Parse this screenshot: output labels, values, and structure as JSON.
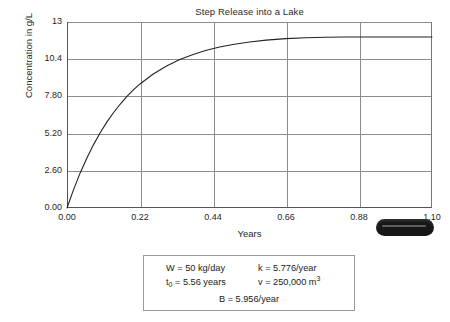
{
  "chart_data": {
    "type": "line",
    "title": "Step Release into a Lake",
    "xlabel": "Years",
    "ylabel": "Concentration in g/L",
    "xlim": [
      0.0,
      1.1
    ],
    "ylim": [
      0.0,
      13.0
    ],
    "grid": true,
    "legend": "none",
    "xticks": [
      "0.00",
      "0.22",
      "0.44",
      "0.66",
      "0.88",
      "1.10"
    ],
    "xtick_values": [
      0.0,
      0.22,
      0.44,
      0.66,
      0.88,
      1.1
    ],
    "yticks": [
      "0.00",
      "2.60",
      "5.20",
      "7.80",
      "10.4",
      "13"
    ],
    "ytick_values": [
      0.0,
      2.6,
      5.2,
      7.8,
      10.4,
      13.0
    ],
    "series": [
      {
        "name": "Concentration",
        "model": "C(t) = 11.95 * (1 - exp(-5.776 t))",
        "x": [
          0.0,
          0.02,
          0.04,
          0.06,
          0.08,
          0.1,
          0.12,
          0.14,
          0.16,
          0.18,
          0.2,
          0.22,
          0.26,
          0.3,
          0.34,
          0.38,
          0.42,
          0.46,
          0.5,
          0.55,
          0.6,
          0.66,
          0.72,
          0.78,
          0.84,
          0.9,
          0.96,
          1.02,
          1.1
        ],
        "y": [
          0.0,
          1.3,
          2.47,
          3.5,
          4.43,
          5.26,
          6.0,
          6.66,
          7.25,
          7.78,
          8.25,
          8.67,
          9.37,
          9.93,
          10.38,
          10.73,
          11.02,
          11.25,
          11.43,
          11.6,
          11.73,
          11.84,
          11.9,
          11.93,
          11.95,
          11.95,
          11.95,
          11.95,
          11.95
        ]
      }
    ],
    "asymptote": 11.95
  },
  "parameters": {
    "w_label": "W = 50 kg/day",
    "t0_prefix": "t",
    "t0_sub": "0",
    "t0_suffix": " = 5.56 years",
    "k_label": "k = 5.776/year",
    "v_prefix": "v = 250,000 m",
    "v_sup": "3",
    "b_label": "B = 5.956/year"
  },
  "artifact": {
    "name": "scan-smudge",
    "color": "#171717"
  }
}
